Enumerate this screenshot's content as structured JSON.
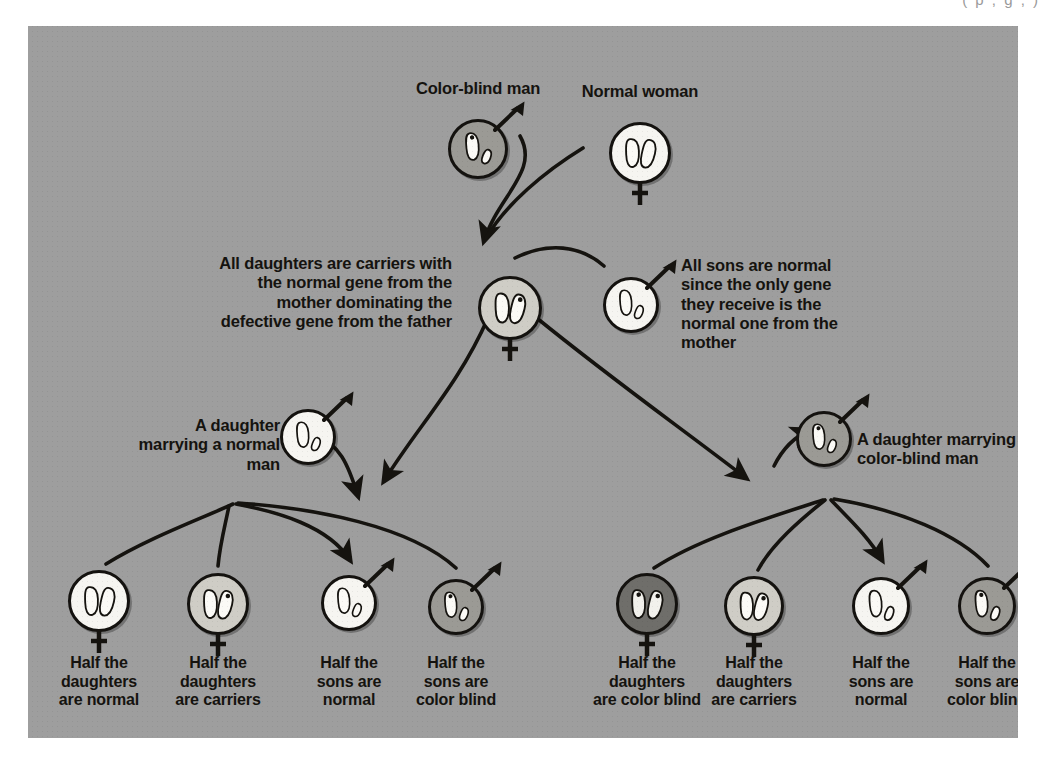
{
  "page": {
    "top_clipped_caption": "( p , g , )",
    "panel_color": "#9e9e9e",
    "ink_color": "#15130f"
  },
  "diagram": {
    "title_hidden": "",
    "generation1": [
      {
        "id": "father",
        "name": "color-blind-man",
        "label": "Color-blind man",
        "sex": "male",
        "fill": "gray",
        "genotype": "one long chromosome with defective gene, one short Y",
        "x": 450,
        "y": 123,
        "r": 30
      },
      {
        "id": "mother",
        "name": "normal-woman",
        "label": "Normal woman",
        "sex": "female",
        "fill": "white",
        "genotype": "two long normal chromosomes",
        "x": 612,
        "y": 127,
        "r": 31
      }
    ],
    "generation2": [
      {
        "id": "carrier-daughter",
        "name": "carrier-daughter",
        "label": "",
        "sex": "female",
        "fill": "light",
        "x": 482,
        "y": 282,
        "r": 32
      },
      {
        "id": "normal-son",
        "name": "normal-son",
        "label": "",
        "sex": "male",
        "fill": "white",
        "x": 603,
        "y": 279,
        "r": 28
      }
    ],
    "notes": [
      {
        "id": "note-daughters",
        "name": "note-all-daughters-carriers",
        "text": "All daughters are carriers with the normal gene from the mother dominating the defective gene from the father",
        "align": "right",
        "x": 176,
        "y": 228,
        "w": 248
      },
      {
        "id": "note-sons",
        "name": "note-all-sons-normal",
        "text": "All sons are normal since the only gene they receive is the normal one from the mother",
        "align": "left",
        "x": 653,
        "y": 230,
        "w": 176
      }
    ],
    "spouses": [
      {
        "id": "normal-husband",
        "name": "normal-man-spouse",
        "label": "A daughter marrying a normal man",
        "label_align": "right",
        "sex": "male",
        "fill": "white",
        "x": 280,
        "y": 411,
        "r": 28,
        "label_x": 100,
        "label_y": 390,
        "label_w": 152
      },
      {
        "id": "colorblind-husband",
        "name": "color-blind-man-spouse",
        "label": "A daughter marrying color-blind man",
        "label_align": "left",
        "sex": "male",
        "fill": "gray",
        "x": 796,
        "y": 413,
        "r": 28,
        "label_x": 829,
        "label_y": 404,
        "label_w": 170
      }
    ],
    "generation3_left": [
      {
        "id": "l1",
        "name": "half-daughters-normal",
        "label": "Half the daughters are normal",
        "sex": "female",
        "fill": "white",
        "x": 71,
        "y": 575,
        "r": 31
      },
      {
        "id": "l2",
        "name": "half-daughters-carriers",
        "label": "Half the daughters are carriers",
        "sex": "female",
        "fill": "light",
        "x": 190,
        "y": 578,
        "r": 31
      },
      {
        "id": "l3",
        "name": "half-sons-normal",
        "label": "Half the sons are normal",
        "sex": "male",
        "fill": "white",
        "x": 321,
        "y": 577,
        "r": 28
      },
      {
        "id": "l4",
        "name": "half-sons-color-blind",
        "label": "Half the sons are color blind",
        "sex": "male",
        "fill": "gray",
        "x": 428,
        "y": 581,
        "r": 28
      }
    ],
    "generation3_right": [
      {
        "id": "r1",
        "name": "half-daughters-color-blind",
        "label": "Half the daughters are color blind",
        "sex": "female",
        "fill": "dark",
        "x": 619,
        "y": 578,
        "r": 31
      },
      {
        "id": "r2",
        "name": "half-daughters-carriers-right",
        "label": "Half the daughters are carriers",
        "sex": "female",
        "fill": "light",
        "x": 726,
        "y": 580,
        "r": 30
      },
      {
        "id": "r3",
        "name": "half-sons-normal-right",
        "label": "Half the sons are normal",
        "sex": "male",
        "fill": "white",
        "x": 853,
        "y": 580,
        "r": 29
      },
      {
        "id": "r4",
        "name": "half-sons-color-blind-right",
        "label": "Half the sons are color blind",
        "sex": "male",
        "fill": "gray",
        "x": 959,
        "y": 580,
        "r": 29
      }
    ],
    "bottom_labels": [
      {
        "name": "label-half-daughters-normal",
        "lines": [
          "Half the",
          "daughters",
          "are normal"
        ],
        "cx": 71
      },
      {
        "name": "label-half-daughters-carriers",
        "lines": [
          "Half the",
          "daughters",
          "are carriers"
        ],
        "cx": 190
      },
      {
        "name": "label-half-sons-normal",
        "lines": [
          "Half the",
          "sons are",
          "normal"
        ],
        "cx": 321
      },
      {
        "name": "label-half-sons-color-blind",
        "lines": [
          "Half the",
          "sons are",
          "color blind"
        ],
        "cx": 428
      },
      {
        "name": "label-half-daughters-color-blind",
        "lines": [
          "Half the",
          "daughters",
          "are color blind"
        ],
        "cx": 619
      },
      {
        "name": "label-half-daughters-carriers-right",
        "lines": [
          "Half the",
          "daughters",
          "are carriers"
        ],
        "cx": 726
      },
      {
        "name": "label-half-sons-normal-right",
        "lines": [
          "Half the",
          "sons are",
          "normal"
        ],
        "cx": 853
      },
      {
        "name": "label-half-sons-color-blind-right",
        "lines": [
          "Half the",
          "sons are",
          "color blind"
        ],
        "cx": 959
      }
    ]
  }
}
